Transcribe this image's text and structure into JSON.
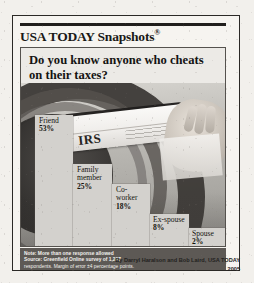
{
  "masthead": {
    "brand": "USA TODAY Snapshots",
    "registered_mark": "®"
  },
  "question": "Do you know anyone who cheats on their taxes?",
  "photo": {
    "envelope_text": "IRS",
    "description": "hand inserting an IRS envelope into a dark mail slot"
  },
  "note": {
    "line1": "Note: More than one response allowed",
    "line2": "Source: Greenfield Online survey of 1,207",
    "line3": "respondents. Margin of error ±4 percentage points."
  },
  "byline": {
    "credit": "By Darryl Haralson and Bob Laird, USA TODAY",
    "year": "2005"
  },
  "colors": {
    "page": "#f2f0ec",
    "frame": "#2b2926",
    "bar_fill": "#d3d1cd",
    "note_box": "#5d5955",
    "rule": "#211f1d"
  },
  "chart_data": {
    "type": "bar",
    "title": "Do you know anyone who cheats on their taxes?",
    "xlabel": "",
    "ylabel": "",
    "ylim": [
      0,
      53
    ],
    "grid": false,
    "legend": "none",
    "categories": [
      "Friend",
      "Family member",
      "Co-worker",
      "Ex-spouse",
      "Spouse"
    ],
    "values": [
      53,
      25,
      18,
      8,
      2
    ],
    "value_labels": [
      "53%",
      "25%",
      "18%",
      "8%",
      "2%"
    ],
    "annotations": [
      "Note: More than one response allowed",
      "Source: Greenfield Online survey of 1,207 respondents. Margin of error ±4 percentage points."
    ],
    "bars": [
      {
        "label_line1": "Friend",
        "label_line2": "",
        "value": "53%"
      },
      {
        "label_line1": "Family",
        "label_line2": "member",
        "value": "25%"
      },
      {
        "label_line1": "Co-",
        "label_line2": "worker",
        "value": "18%"
      },
      {
        "label_line1": "Ex-spouse",
        "label_line2": "",
        "value": "8%"
      },
      {
        "label_line1": "Spouse",
        "label_line2": "",
        "value": "2%"
      }
    ]
  }
}
